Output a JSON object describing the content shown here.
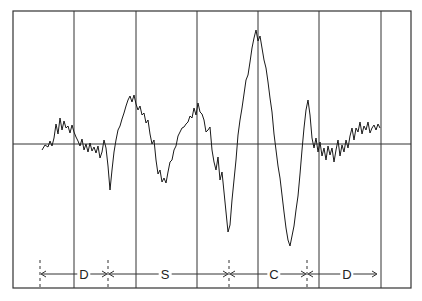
{
  "chart_data": {
    "type": "line",
    "title": "",
    "xlabel": "",
    "ylabel": "",
    "grid": true,
    "frame": {
      "left": 13,
      "top": 11,
      "right": 411,
      "bottom": 288
    },
    "baseline_y": 144,
    "vertical_gridlines_x": [
      74,
      136,
      197,
      258,
      319,
      381
    ],
    "segments": [
      {
        "label": "D",
        "start_x": 40,
        "end_x": 108,
        "label_x": 84
      },
      {
        "label": "S",
        "start_x": 108,
        "end_x": 229,
        "label_x": 165
      },
      {
        "label": "C",
        "start_x": 229,
        "end_x": 307,
        "label_x": 274
      },
      {
        "label": "D",
        "start_x": 307,
        "end_x": 378,
        "label_x": 347
      }
    ],
    "segment_marker_y": 274,
    "waveform": {
      "description": "noisy trace with major excursions: small rise in D, slow wave in S, large biphasic swing in C, low-amplitude noise in second D",
      "points": [
        [
          42,
          150
        ],
        [
          45,
          145
        ],
        [
          48,
          147
        ],
        [
          50,
          141
        ],
        [
          52,
          146
        ],
        [
          54,
          138
        ],
        [
          56,
          124
        ],
        [
          58,
          134
        ],
        [
          60,
          118
        ],
        [
          62,
          130
        ],
        [
          64,
          121
        ],
        [
          66,
          128
        ],
        [
          68,
          126
        ],
        [
          70,
          133
        ],
        [
          72,
          125
        ],
        [
          74,
          132
        ],
        [
          76,
          137
        ],
        [
          78,
          141
        ],
        [
          80,
          146
        ],
        [
          82,
          139
        ],
        [
          84,
          150
        ],
        [
          86,
          144
        ],
        [
          88,
          152
        ],
        [
          90,
          143
        ],
        [
          92,
          151
        ],
        [
          94,
          147
        ],
        [
          96,
          153
        ],
        [
          98,
          146
        ],
        [
          100,
          158
        ],
        [
          102,
          152
        ],
        [
          104,
          140
        ],
        [
          106,
          148
        ],
        [
          108,
          166
        ],
        [
          110,
          190
        ],
        [
          112,
          170
        ],
        [
          114,
          152
        ],
        [
          116,
          140
        ],
        [
          118,
          130
        ],
        [
          120,
          126
        ],
        [
          122,
          119
        ],
        [
          124,
          113
        ],
        [
          126,
          106
        ],
        [
          128,
          100
        ],
        [
          130,
          96
        ],
        [
          132,
          102
        ],
        [
          134,
          95
        ],
        [
          136,
          104
        ],
        [
          138,
          110
        ],
        [
          140,
          106
        ],
        [
          142,
          115
        ],
        [
          144,
          113
        ],
        [
          146,
          123
        ],
        [
          148,
          120
        ],
        [
          150,
          134
        ],
        [
          152,
          144
        ],
        [
          154,
          140
        ],
        [
          156,
          160
        ],
        [
          158,
          174
        ],
        [
          160,
          170
        ],
        [
          162,
          182
        ],
        [
          164,
          178
        ],
        [
          166,
          183
        ],
        [
          168,
          172
        ],
        [
          170,
          162
        ],
        [
          172,
          160
        ],
        [
          174,
          150
        ],
        [
          176,
          146
        ],
        [
          178,
          136
        ],
        [
          180,
          132
        ],
        [
          182,
          128
        ],
        [
          184,
          127
        ],
        [
          186,
          124
        ],
        [
          188,
          122
        ],
        [
          190,
          116
        ],
        [
          192,
          118
        ],
        [
          194,
          108
        ],
        [
          196,
          115
        ],
        [
          198,
          103
        ],
        [
          200,
          112
        ],
        [
          202,
          114
        ],
        [
          204,
          120
        ],
        [
          206,
          132
        ],
        [
          208,
          130
        ],
        [
          210,
          127
        ],
        [
          212,
          150
        ],
        [
          214,
          162
        ],
        [
          216,
          170
        ],
        [
          218,
          157
        ],
        [
          220,
          180
        ],
        [
          222,
          172
        ],
        [
          224,
          192
        ],
        [
          226,
          212
        ],
        [
          228,
          232
        ],
        [
          230,
          225
        ],
        [
          232,
          200
        ],
        [
          234,
          180
        ],
        [
          236,
          160
        ],
        [
          238,
          135
        ],
        [
          240,
          120
        ],
        [
          242,
          108
        ],
        [
          244,
          94
        ],
        [
          246,
          80
        ],
        [
          248,
          75
        ],
        [
          250,
          62
        ],
        [
          252,
          48
        ],
        [
          254,
          38
        ],
        [
          256,
          30
        ],
        [
          258,
          41
        ],
        [
          260,
          36
        ],
        [
          262,
          48
        ],
        [
          264,
          60
        ],
        [
          266,
          68
        ],
        [
          268,
          82
        ],
        [
          270,
          98
        ],
        [
          272,
          112
        ],
        [
          274,
          134
        ],
        [
          276,
          150
        ],
        [
          278,
          166
        ],
        [
          280,
          178
        ],
        [
          282,
          195
        ],
        [
          284,
          212
        ],
        [
          286,
          228
        ],
        [
          288,
          240
        ],
        [
          290,
          246
        ],
        [
          292,
          236
        ],
        [
          294,
          226
        ],
        [
          296,
          210
        ],
        [
          298,
          196
        ],
        [
          300,
          174
        ],
        [
          302,
          150
        ],
        [
          304,
          128
        ],
        [
          306,
          110
        ],
        [
          308,
          100
        ],
        [
          310,
          115
        ],
        [
          312,
          138
        ],
        [
          314,
          148
        ],
        [
          316,
          138
        ],
        [
          318,
          152
        ],
        [
          320,
          142
        ],
        [
          322,
          156
        ],
        [
          324,
          148
        ],
        [
          326,
          160
        ],
        [
          328,
          146
        ],
        [
          330,
          155
        ],
        [
          332,
          148
        ],
        [
          334,
          162
        ],
        [
          336,
          150
        ],
        [
          338,
          140
        ],
        [
          340,
          156
        ],
        [
          342,
          145
        ],
        [
          344,
          152
        ],
        [
          346,
          140
        ],
        [
          348,
          148
        ],
        [
          350,
          136
        ],
        [
          352,
          128
        ],
        [
          354,
          140
        ],
        [
          356,
          128
        ],
        [
          358,
          132
        ],
        [
          360,
          122
        ],
        [
          362,
          134
        ],
        [
          364,
          126
        ],
        [
          366,
          130
        ],
        [
          368,
          122
        ],
        [
          370,
          133
        ],
        [
          372,
          128
        ],
        [
          374,
          125
        ],
        [
          376,
          130
        ],
        [
          378,
          124
        ],
        [
          380,
          128
        ]
      ]
    }
  },
  "labels": {
    "seg1": "D",
    "seg2": "S",
    "seg3": "C",
    "seg4": "D"
  },
  "colors": {
    "line": "#1a1a1a",
    "grid": "#333333",
    "background": "#ffffff"
  }
}
